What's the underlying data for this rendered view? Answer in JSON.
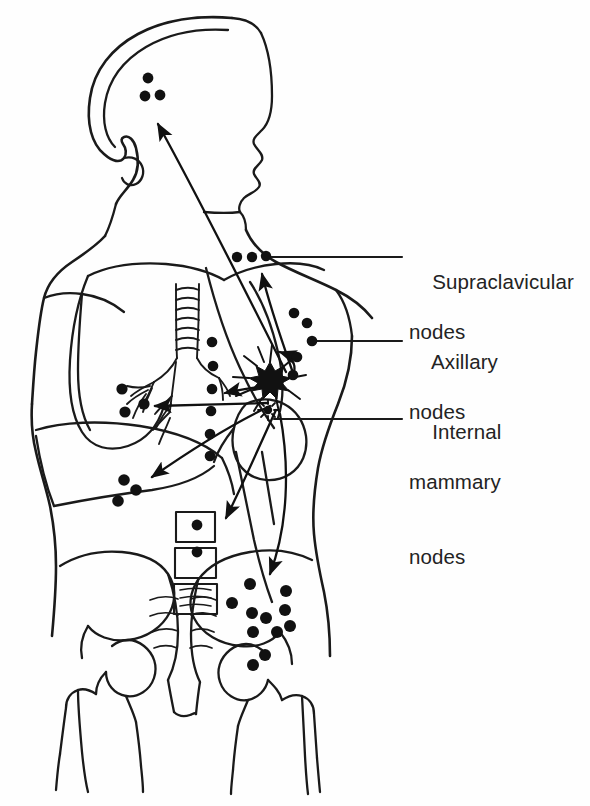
{
  "figure": {
    "background_color": "#fefefe",
    "ink_color": "#1a1a1a",
    "node_color": "#111111"
  },
  "labels": {
    "supraclavicular": {
      "line1": "Supraclavicular",
      "line2": "nodes"
    },
    "axillary": {
      "line1": "Axillary",
      "line2": "nodes"
    },
    "internal_mammary": {
      "line1": "Internal",
      "line2": "mammary",
      "line3": "nodes"
    }
  },
  "leader_lines": [
    {
      "name": "supraclavicular-leader",
      "x1": 266,
      "y1": 257,
      "x2": 402,
      "y2": 257
    },
    {
      "name": "axillary-leader",
      "x1": 314,
      "y1": 341,
      "x2": 402,
      "y2": 341
    },
    {
      "name": "internal-mammary-leader",
      "x1": 274,
      "y1": 419,
      "x2": 402,
      "y2": 419
    }
  ],
  "node_groups": [
    {
      "name": "cervical-head-nodes",
      "count": 3,
      "radius": 5.4,
      "points": [
        [
          148,
          78
        ],
        [
          160,
          95
        ],
        [
          145,
          96
        ]
      ]
    },
    {
      "name": "supraclavicular-nodes",
      "count": 3,
      "radius": 5.2,
      "points": [
        [
          237,
          257
        ],
        [
          252,
          257
        ],
        [
          266,
          256
        ]
      ]
    },
    {
      "name": "axillary-nodes",
      "count": 5,
      "radius": 5.3,
      "points": [
        [
          294,
          313
        ],
        [
          307,
          323
        ],
        [
          312,
          341
        ],
        [
          297,
          357
        ],
        [
          293,
          375
        ]
      ]
    },
    {
      "name": "mediastinal-nodes",
      "count": 6,
      "radius": 5.3,
      "points": [
        [
          212,
          342
        ],
        [
          213,
          366
        ],
        [
          212,
          389
        ],
        [
          211,
          411
        ],
        [
          210,
          434
        ],
        [
          210,
          456
        ]
      ]
    },
    {
      "name": "hepatic-nodes",
      "count": 3,
      "radius": 5.6,
      "points": [
        [
          122,
          389
        ],
        [
          144,
          404
        ],
        [
          125,
          412
        ]
      ]
    },
    {
      "name": "abdominal-nodes",
      "count": 3,
      "radius": 5.8,
      "points": [
        [
          124,
          480
        ],
        [
          136,
          490
        ],
        [
          118,
          501
        ]
      ]
    },
    {
      "name": "vertebral-nodes",
      "count": 2,
      "radius": 5.4,
      "points": [
        [
          197,
          525
        ],
        [
          197,
          552
        ]
      ]
    },
    {
      "name": "pelvic-iliac-nodes",
      "count": 11,
      "radius": 6.0,
      "points": [
        [
          250,
          584
        ],
        [
          286,
          591
        ],
        [
          232,
          603
        ],
        [
          252,
          613
        ],
        [
          266,
          618
        ],
        [
          285,
          610
        ],
        [
          253,
          632
        ],
        [
          277,
          632
        ],
        [
          290,
          626
        ],
        [
          265,
          655
        ],
        [
          253,
          665
        ]
      ]
    }
  ],
  "lesions": [
    {
      "name": "primary-breast-tumor",
      "cx": 270,
      "cy": 377,
      "type": "stellate-mass"
    },
    {
      "name": "nipple-areola-marker",
      "cx": 268,
      "cy": 410,
      "type": "radiating-dot"
    }
  ],
  "arrows": [
    {
      "name": "arrow-to-head-cervical",
      "from": [
        280,
        372
      ],
      "to": [
        156,
        120
      ]
    },
    {
      "name": "arrow-to-supraclavicular",
      "from": [
        288,
        372
      ],
      "to": [
        262,
        272
      ]
    },
    {
      "name": "arrow-to-axillary",
      "from": [
        288,
        372
      ],
      "to": [
        277,
        354
      ]
    },
    {
      "name": "arrow-to-mediastinal",
      "from": [
        268,
        388
      ],
      "to": [
        222,
        394
      ]
    },
    {
      "name": "arrow-to-hepatic",
      "from": [
        272,
        404
      ],
      "to": [
        150,
        406
      ]
    },
    {
      "name": "arrow-to-abdominal",
      "from": [
        272,
        406
      ],
      "to": [
        146,
        480
      ]
    },
    {
      "name": "arrow-to-lumbar",
      "from": [
        276,
        410
      ],
      "to": [
        222,
        524
      ]
    },
    {
      "name": "arrow-to-pelvic",
      "from": [
        278,
        412
      ],
      "to": [
        268,
        580
      ]
    }
  ]
}
